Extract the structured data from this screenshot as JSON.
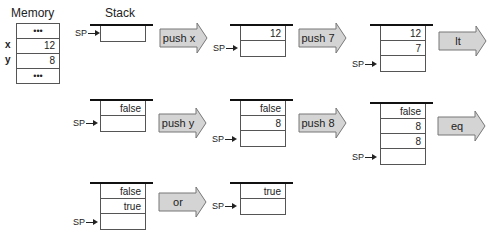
{
  "memory": {
    "title": "Memory",
    "rows": [
      {
        "label": "",
        "value": "•••",
        "dots": true
      },
      {
        "label": "x",
        "value": "12",
        "dots": false
      },
      {
        "label": "y",
        "value": "8",
        "dots": false
      },
      {
        "label": "",
        "value": "•••",
        "dots": true
      }
    ]
  },
  "stack_title": "Stack",
  "sp_label": "SP",
  "operations": [
    "push x",
    "push 7",
    "lt",
    "push y",
    "push 8",
    "eq",
    "or"
  ],
  "stacks": [
    {
      "id": "s0",
      "cells": [
        ""
      ]
    },
    {
      "id": "s1",
      "cells": [
        "12",
        ""
      ]
    },
    {
      "id": "s2",
      "cells": [
        "12",
        "7",
        ""
      ]
    },
    {
      "id": "s3",
      "cells": [
        "false",
        ""
      ]
    },
    {
      "id": "s4",
      "cells": [
        "false",
        "8",
        ""
      ]
    },
    {
      "id": "s5",
      "cells": [
        "false",
        "8",
        "8",
        ""
      ]
    },
    {
      "id": "s6",
      "cells": [
        "false",
        "true",
        ""
      ]
    },
    {
      "id": "s7",
      "cells": [
        "true",
        ""
      ]
    }
  ],
  "colors": {
    "arrow_fill": "#d4d4d4",
    "arrow_stroke": "#777777",
    "border": "#555555"
  }
}
